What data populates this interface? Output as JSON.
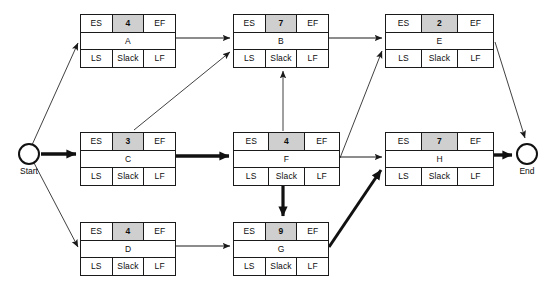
{
  "diagram": {
    "type": "activity-on-node-network",
    "title": "",
    "cell_labels": {
      "es": "ES",
      "ef": "EF",
      "ls": "LS",
      "lf": "LF",
      "slack": "Slack"
    },
    "terminals": [
      {
        "id": "start",
        "label": "Start",
        "x": 18,
        "y": 143
      },
      {
        "id": "end",
        "label": "End",
        "x": 516,
        "y": 143
      }
    ],
    "nodes": [
      {
        "id": "A",
        "name": "A",
        "duration": "4",
        "es": "ES",
        "ef": "EF",
        "ls": "LS",
        "lf": "LF",
        "slack": "Slack",
        "x": 80,
        "y": 14,
        "w": 96,
        "h": 54
      },
      {
        "id": "B",
        "name": "B",
        "duration": "7",
        "es": "ES",
        "ef": "EF",
        "ls": "LS",
        "lf": "LF",
        "slack": "Slack",
        "x": 233,
        "y": 14,
        "w": 96,
        "h": 54
      },
      {
        "id": "E",
        "name": "E",
        "duration": "2",
        "es": "ES",
        "ef": "EF",
        "ls": "LS",
        "lf": "LF",
        "slack": "Slack",
        "x": 385,
        "y": 14,
        "w": 109,
        "h": 54
      },
      {
        "id": "C",
        "name": "C",
        "duration": "3",
        "es": "ES",
        "ef": "EF",
        "ls": "LS",
        "lf": "LF",
        "slack": "Slack",
        "x": 80,
        "y": 132,
        "w": 96,
        "h": 54
      },
      {
        "id": "F",
        "name": "F",
        "duration": "4",
        "es": "ES",
        "ef": "EF",
        "ls": "LS",
        "lf": "LF",
        "slack": "Slack",
        "x": 233,
        "y": 132,
        "w": 107,
        "h": 54
      },
      {
        "id": "H",
        "name": "H",
        "duration": "7",
        "es": "ES",
        "ef": "EF",
        "ls": "LS",
        "lf": "LF",
        "slack": "Slack",
        "x": 385,
        "y": 132,
        "w": 109,
        "h": 54
      },
      {
        "id": "D",
        "name": "D",
        "duration": "4",
        "es": "ES",
        "ef": "EF",
        "ls": "LS",
        "lf": "LF",
        "slack": "Slack",
        "x": 80,
        "y": 222,
        "w": 96,
        "h": 54
      },
      {
        "id": "G",
        "name": "G",
        "duration": "9",
        "es": "ES",
        "ef": "EF",
        "ls": "LS",
        "lf": "LF",
        "slack": "Slack",
        "x": 233,
        "y": 222,
        "w": 96,
        "h": 54
      }
    ],
    "edges": [
      {
        "id": "start-A",
        "from": "Start",
        "to": "A",
        "critical": false
      },
      {
        "id": "start-C",
        "from": "Start",
        "to": "C",
        "critical": true
      },
      {
        "id": "start-D",
        "from": "Start",
        "to": "D",
        "critical": false
      },
      {
        "id": "A-B",
        "from": "A",
        "to": "B",
        "critical": false
      },
      {
        "id": "C-B",
        "from": "C",
        "to": "B",
        "critical": false
      },
      {
        "id": "C-F",
        "from": "C",
        "to": "F",
        "critical": true
      },
      {
        "id": "D-G",
        "from": "D",
        "to": "G",
        "critical": false
      },
      {
        "id": "B-E",
        "from": "B",
        "to": "E",
        "critical": false
      },
      {
        "id": "F-B",
        "from": "F",
        "to": "B",
        "critical": false
      },
      {
        "id": "F-E",
        "from": "F",
        "to": "E",
        "critical": false
      },
      {
        "id": "F-H",
        "from": "F",
        "to": "H",
        "critical": false
      },
      {
        "id": "F-G",
        "from": "F",
        "to": "G",
        "critical": true
      },
      {
        "id": "G-H",
        "from": "G",
        "to": "H",
        "critical": true
      },
      {
        "id": "E-End",
        "from": "E",
        "to": "End",
        "critical": false
      },
      {
        "id": "H-End",
        "from": "H",
        "to": "End",
        "critical": true
      }
    ],
    "colors": {
      "line": "#1a1a1a",
      "duration_fill": "#cfcfcf",
      "node_fill": "#ffffff",
      "background": "#ffffff"
    }
  }
}
